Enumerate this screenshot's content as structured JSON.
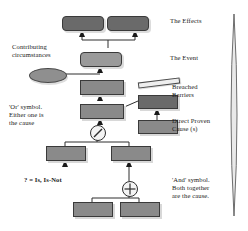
{
  "diagram": {
    "labels": [
      {
        "id": "the-effects",
        "text": "The Effects",
        "x": 170,
        "y": 17
      },
      {
        "id": "contributing-circumstances",
        "text": "Contributing\ncircumstances",
        "x": 12,
        "y": 43
      },
      {
        "id": "the-event",
        "text": "The Event",
        "x": 170,
        "y": 54
      },
      {
        "id": "breached-barriers",
        "text": "Breached\nBarriers",
        "x": 172,
        "y": 83
      },
      {
        "id": "or-symbol-note",
        "text": "'Or' symbol.\nEither one is\nthe cause",
        "x": 9,
        "y": 103
      },
      {
        "id": "direct-proven-cause",
        "text": "Direct Proven\nCause (s)",
        "x": 172,
        "y": 117
      },
      {
        "id": "is-is-not-key",
        "text": "? = Is, Is-Not",
        "x": 24,
        "y": 176
      },
      {
        "id": "and-symbol-note",
        "text": "'And' symbol.\nBoth together\nare the cause.",
        "x": 172,
        "y": 176
      }
    ],
    "nodes": [
      {
        "id": "effect-left",
        "shape": "rounded",
        "tone": "dark",
        "x": 62,
        "y": 16,
        "w": 40,
        "h": 13
      },
      {
        "id": "effect-right",
        "shape": "rounded",
        "tone": "dark",
        "x": 107,
        "y": 16,
        "w": 40,
        "h": 13
      },
      {
        "id": "event",
        "shape": "rounded",
        "tone": "light",
        "x": 80,
        "y": 52,
        "w": 40,
        "h": 13
      },
      {
        "id": "cause-level-1",
        "shape": "rect",
        "tone": "mid",
        "x": 80,
        "y": 80,
        "w": 42,
        "h": 13
      },
      {
        "id": "cause-level-2",
        "shape": "rect",
        "tone": "mid",
        "x": 80,
        "y": 104,
        "w": 42,
        "h": 13
      },
      {
        "id": "or-child-left",
        "shape": "rect",
        "tone": "mid",
        "x": 46,
        "y": 146,
        "w": 38,
        "h": 13
      },
      {
        "id": "or-child-right",
        "shape": "rect",
        "tone": "mid",
        "x": 111,
        "y": 146,
        "w": 38,
        "h": 13
      },
      {
        "id": "and-child-left",
        "shape": "rect",
        "tone": "mid",
        "x": 73,
        "y": 202,
        "w": 38,
        "h": 13
      },
      {
        "id": "and-child-right",
        "shape": "rect",
        "tone": "mid",
        "x": 120,
        "y": 202,
        "w": 38,
        "h": 13
      },
      {
        "id": "barrier-box",
        "shape": "rect",
        "tone": "dark",
        "x": 138,
        "y": 95,
        "w": 38,
        "h": 12
      },
      {
        "id": "direct-cause-box",
        "shape": "rect",
        "tone": "mid",
        "x": 138,
        "y": 120,
        "w": 38,
        "h": 12
      }
    ],
    "ellipse": {
      "id": "contributing-circumstances-oval",
      "x": 29,
      "y": 68,
      "w": 36,
      "h": 13
    },
    "barriers": [
      {
        "id": "breached-barrier-bar",
        "x": 138,
        "y": 80,
        "w": 40,
        "h": 5,
        "rotate": -7
      }
    ],
    "gates": [
      {
        "id": "or-gate",
        "type": "or",
        "symbol": "slash",
        "cx": 97,
        "cy": 132,
        "r": 7
      },
      {
        "id": "and-gate",
        "type": "and",
        "symbol": "cross",
        "cx": 129,
        "cy": 188,
        "r": 7
      }
    ],
    "sliver": {
      "id": "right-edge-sliver",
      "x": 228,
      "y": 14,
      "w": 12,
      "h": 202
    },
    "colors": {
      "node_dark": "#6a6a6a",
      "node_mid": "#8a8a8a",
      "node_light": "#9a9a9a",
      "stroke": "#2e2e2e",
      "shadow": "#d8d8d8",
      "text": "#1a1a1a",
      "background": "#ffffff"
    }
  }
}
